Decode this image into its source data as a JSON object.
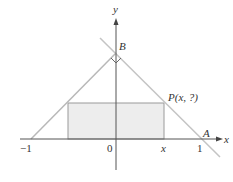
{
  "diagram": {
    "type": "coordinate-geometry",
    "colors": {
      "axis": "#555555",
      "triangle_lines": "#b5b5b5",
      "rectangle_fill": "#ededed",
      "rectangle_stroke": "#999999",
      "text": "#333333"
    },
    "axes": {
      "x_label": "x",
      "y_label": "y"
    },
    "tick_labels": {
      "neg_one": "−1",
      "zero": "0",
      "x": "x",
      "one": "1"
    },
    "points": {
      "A": "A",
      "B": "B",
      "P": "P(x, ?)"
    },
    "right_angle_marker_at": "B"
  }
}
